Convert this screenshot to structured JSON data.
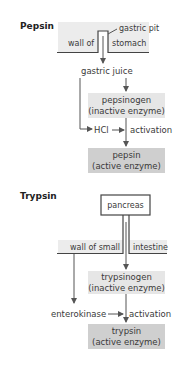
{
  "colors": {
    "band": "#ececec",
    "inactive_box": "#e6e6e6",
    "active_box": "#cfcfcf",
    "line": "#555555",
    "text": "#3a3a3a"
  },
  "pepsin": {
    "title": "Pepsin",
    "gastric_pit": "gastric pit",
    "wall_left": "wall of",
    "wall_right": "stomach",
    "gastric_juice": "gastric juice",
    "inactive": {
      "name": "pepsinogen",
      "desc": "(inactive enzyme)"
    },
    "activator": "HCl",
    "activation": "activation",
    "active": {
      "name": "pepsin",
      "desc": "(active enzyme)"
    }
  },
  "trypsin": {
    "title": "Trypsin",
    "source": "pancreas",
    "wall_left": "wall of small",
    "wall_right": "intestine",
    "inactive": {
      "name": "trypsinogen",
      "desc": "(inactive enzyme)"
    },
    "activator": "enterokinase",
    "activation": "activation",
    "active": {
      "name": "trypsin",
      "desc": "(active enzyme)"
    }
  }
}
